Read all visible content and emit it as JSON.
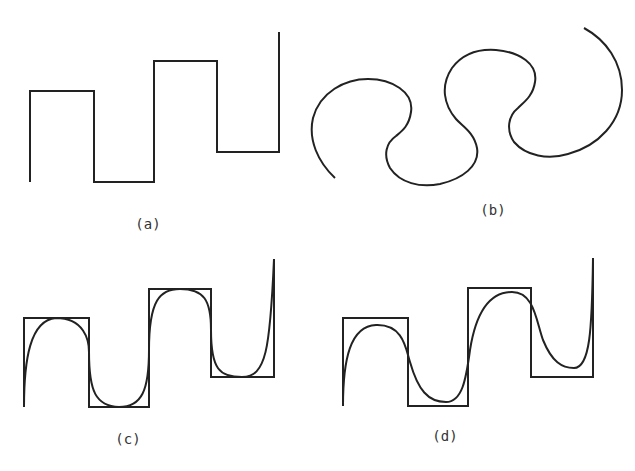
{
  "figure": {
    "stroke_color": "#222222",
    "panels": [
      {
        "id": "a",
        "label": "(a)",
        "description": "Square-wave polyline (control polygon)"
      },
      {
        "id": "b",
        "label": "(b)",
        "description": "Smooth S-shaped curve with three lobes"
      },
      {
        "id": "c",
        "label": "(c)",
        "description": "Square-wave polygon with closely fitting smooth curve"
      },
      {
        "id": "d",
        "label": "(d)",
        "description": "Square-wave polygon with loosely fitting smooth curve"
      }
    ]
  }
}
